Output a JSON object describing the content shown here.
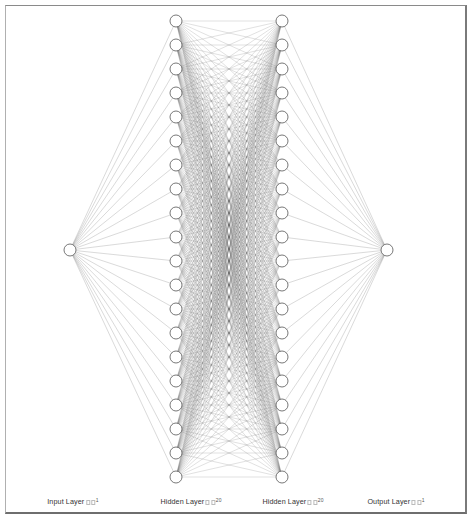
{
  "diagram": {
    "type": "neural-network",
    "background": "#ffffff",
    "edge_color": "#606060",
    "node_stroke": "#555555",
    "node_fill": "#ffffff",
    "node_radius": 6,
    "layers": [
      {
        "name": "Input Layer",
        "label": "Input Layer",
        "suffix": "1",
        "size": 1,
        "x": 70
      },
      {
        "name": "Hidden Layer",
        "label": "Hidden Layer",
        "suffix": "20",
        "size": 20,
        "x": 176
      },
      {
        "name": "Hidden Layer",
        "label": "Hidden Layer",
        "suffix": "20",
        "size": 20,
        "x": 282
      },
      {
        "name": "Output Layer",
        "label": "Output Layer",
        "suffix": "1",
        "size": 1,
        "x": 387
      }
    ],
    "y_top": 21,
    "y_bottom": 477,
    "y_center": 250
  },
  "labels": {
    "input": "Input Layer",
    "input_sup": "1",
    "hidden1": "Hidden Layer",
    "hidden1_sup": "20",
    "hidden2": "Hidden Layer",
    "hidden2_sup": "20",
    "output": "Output Layer",
    "output_sup": "1"
  }
}
